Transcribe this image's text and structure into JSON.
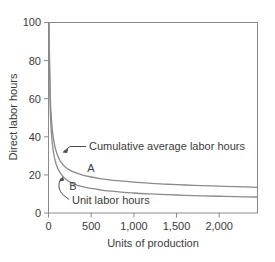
{
  "colors": {
    "background": "#ffffff",
    "frame": "#8a8a8a",
    "curve": "#8a8a8a",
    "text": "#3b3b3b",
    "leader": "#4a4a4a"
  },
  "chart_data": {
    "type": "line",
    "title": "",
    "subtitle": "",
    "xlabel": "Units of production",
    "ylabel": "Direct labor hours",
    "xlim": [
      0,
      2450
    ],
    "ylim": [
      0,
      100
    ],
    "xticks": [
      0,
      500,
      1000,
      1500,
      2000
    ],
    "xtick_labels": [
      "0",
      "500",
      "1,000",
      "1,500",
      "2,000"
    ],
    "yticks": [
      0,
      20,
      40,
      60,
      80,
      100
    ],
    "ytick_labels": [
      "0",
      "20",
      "40",
      "60",
      "80",
      "100"
    ],
    "grid": false,
    "legend_position": "inline-annotations",
    "series": [
      {
        "name": "Cumulative average labor hours",
        "tag": "A",
        "x": [
          5,
          20,
          40,
          60,
          80,
          100,
          125,
          150,
          200,
          250,
          300,
          400,
          500,
          600,
          700,
          800,
          1000,
          1200,
          1400,
          1600,
          1800,
          2000,
          2200,
          2450
        ],
        "values": [
          100,
          62,
          46,
          38.5,
          34,
          31,
          28.4,
          26.5,
          24,
          22.5,
          21.4,
          19.9,
          18.9,
          18.1,
          17.5,
          17.0,
          16.2,
          15.6,
          15.1,
          14.7,
          14.4,
          14.1,
          13.8,
          13.5
        ]
      },
      {
        "name": "Unit labor hours",
        "tag": "B",
        "x": [
          5,
          20,
          40,
          60,
          80,
          100,
          125,
          150,
          200,
          250,
          300,
          400,
          500,
          600,
          700,
          800,
          1000,
          1200,
          1400,
          1600,
          1800,
          2000,
          2200,
          2450
        ],
        "values": [
          100,
          55,
          39,
          31.5,
          27.2,
          24.4,
          22.0,
          20.3,
          17.9,
          16.3,
          15.2,
          13.8,
          12.9,
          12.2,
          11.6,
          11.2,
          10.5,
          10.0,
          9.6,
          9.3,
          9.0,
          8.8,
          8.6,
          8.4
        ]
      }
    ],
    "annotations": [
      {
        "id": "cumulative-average-annotation",
        "text": "Cumulative average labor hours"
      },
      {
        "id": "unit-labor-annotation",
        "text": "Unit labor hours"
      },
      {
        "id": "curve-a-tag",
        "text": "A"
      },
      {
        "id": "curve-b-tag",
        "text": "B"
      }
    ]
  }
}
